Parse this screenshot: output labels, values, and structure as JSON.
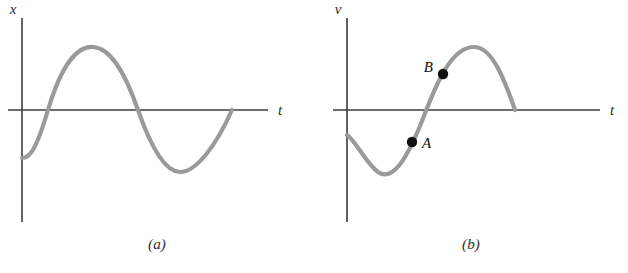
{
  "figure": {
    "background_color": "#ffffff",
    "curve_color": "#9a9a9a",
    "axis_color": "#3c3c3c",
    "marker_color": "#101010",
    "curve_width": 4.2
  },
  "panels": [
    {
      "id": "a",
      "caption": "(a)",
      "y_axis_label": "x",
      "x_axis_label": "t",
      "origin": {
        "x": 22,
        "y": 110
      },
      "y_axis": {
        "top": 18,
        "bottom": 222
      },
      "x_axis": {
        "left": 8,
        "right": 268
      },
      "curve_path": "M 22 158 C 30 158 36 150 48 110 C 62 63 78 46 93 47 C 110 48 124 70 138 110 C 152 150 166 172 180 172 C 196 172 216 146 232 110",
      "markers": []
    },
    {
      "id": "b",
      "caption": "(b)",
      "y_axis_label": "v",
      "x_axis_label": "t",
      "origin": {
        "x": 33,
        "y": 110
      },
      "y_axis": {
        "top": 18,
        "bottom": 222
      },
      "x_axis": {
        "left": 19,
        "right": 286
      },
      "curve_path": "M 33 135 C 41 140 52 163 64 172 C 78 182 92 160 106 126 C 118 96 134 46 161 47 C 178 48 190 78 201 110",
      "markers": [
        {
          "name": "A",
          "label": "A",
          "cx": 98,
          "cy": 142,
          "r": 5.2,
          "label_x": 108,
          "label_y": 148,
          "label_anchor": "start"
        },
        {
          "name": "B",
          "label": "B",
          "cx": 129,
          "cy": 74,
          "r": 5.2,
          "label_x": 119,
          "label_y": 72,
          "label_anchor": "end"
        }
      ]
    }
  ],
  "chart_data": {
    "type": "line",
    "title": "",
    "subplots": [
      {
        "label": "(a)",
        "xlabel": "t",
        "ylabel": "x",
        "curve": "sine",
        "phase_description": "starts below zero, rises through zero to a positive maximum, falls through zero to a negative minimum, then rises back to zero",
        "gridlines": false,
        "tick_labels": [],
        "annotations": []
      },
      {
        "label": "(b)",
        "xlabel": "t",
        "ylabel": "v",
        "curve": "sine",
        "phase_description": "starts below zero, falls to a negative minimum, rises through zero to a positive maximum, then falls back to zero",
        "gridlines": false,
        "tick_labels": [],
        "annotations": [
          {
            "label": "A",
            "position": "on rising part of curve, below the t axis"
          },
          {
            "label": "B",
            "position": "on rising part of curve, above the t axis"
          }
        ]
      }
    ]
  }
}
